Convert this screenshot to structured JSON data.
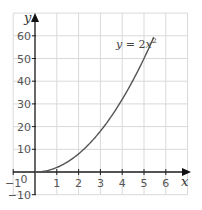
{
  "chart_data": {
    "type": "line",
    "title": "",
    "xlabel": "x",
    "ylabel": "y",
    "xlim": [
      -1,
      7
    ],
    "ylim": [
      -10,
      70
    ],
    "grid": true,
    "x_ticks": [
      -1,
      0,
      1,
      2,
      3,
      4,
      5,
      6
    ],
    "x_tick_labels": [
      "−1",
      "0",
      "1",
      "2",
      "3",
      "4",
      "5",
      "6"
    ],
    "y_ticks": [
      -10,
      10,
      20,
      30,
      40,
      50,
      60
    ],
    "y_tick_labels": [
      "−10",
      "10",
      "20",
      "30",
      "40",
      "50",
      "60"
    ],
    "series": [
      {
        "name": "y = 2x²",
        "function": "y = 2x^2",
        "x": [
          0,
          0.5,
          1,
          1.5,
          2,
          2.5,
          3,
          3.5,
          4,
          4.5,
          5,
          5.45
        ],
        "values": [
          0,
          0.5,
          2,
          4.5,
          8,
          12.5,
          18,
          24.5,
          32,
          40.5,
          50,
          59.4
        ]
      }
    ],
    "annotations": [
      {
        "text": "y = 2x²",
        "x": 4.2,
        "y": 52
      }
    ],
    "colors": {
      "curve": "#555555",
      "grid": "#d9d9d9",
      "axis": "#222222"
    }
  },
  "labels": {
    "x_axis": "x",
    "y_axis": "y",
    "equation_prefix": "y",
    "equation_eq": " = 2",
    "equation_var": "x",
    "equation_exp": "2",
    "origin": "0"
  }
}
